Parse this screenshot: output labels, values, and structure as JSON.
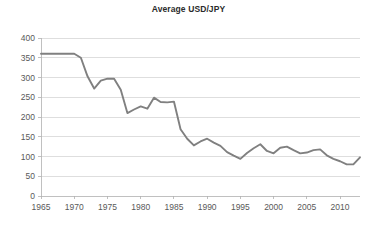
{
  "chart_data": {
    "type": "line",
    "title": "Average USD/JPY",
    "xlabel": "",
    "ylabel": "",
    "xlim": [
      1965,
      2013
    ],
    "ylim": [
      0,
      400
    ],
    "ytick_step": 50,
    "xtick_step": 5,
    "grid": true,
    "legend": false,
    "series_color": "#808080",
    "axis_color": "#b0b0b0",
    "grid_color": "#d0d0d0",
    "text_color": "#595959",
    "yticks": [
      0,
      50,
      100,
      150,
      200,
      250,
      300,
      350,
      400
    ],
    "ytick_labels": [
      "0",
      "50",
      "100",
      "150",
      "200",
      "250",
      "300",
      "350",
      "400"
    ],
    "xticks": [
      1965,
      1970,
      1975,
      1980,
      1985,
      1990,
      1995,
      2000,
      2005,
      2010
    ],
    "xtick_labels": [
      "1965",
      "1970",
      "1975",
      "1980",
      "1985",
      "1990",
      "1995",
      "2000",
      "2005",
      "2010"
    ],
    "x": [
      1965,
      1966,
      1967,
      1968,
      1969,
      1970,
      1971,
      1972,
      1973,
      1974,
      1975,
      1976,
      1977,
      1978,
      1979,
      1980,
      1981,
      1982,
      1983,
      1984,
      1985,
      1986,
      1987,
      1988,
      1989,
      1990,
      1991,
      1992,
      1993,
      1994,
      1995,
      1996,
      1997,
      1998,
      1999,
      2000,
      2001,
      2002,
      2003,
      2004,
      2005,
      2006,
      2007,
      2008,
      2009,
      2010,
      2011,
      2012,
      2013
    ],
    "series": [
      {
        "name": "Average USD/JPY",
        "values": [
          360,
          360,
          360,
          360,
          360,
          360,
          350,
          303,
          272,
          292,
          297,
          297,
          269,
          210,
          219,
          227,
          221,
          249,
          238,
          237,
          239,
          169,
          145,
          128,
          138,
          145,
          135,
          127,
          111,
          102,
          94,
          109,
          121,
          131,
          114,
          108,
          122,
          125,
          116,
          108,
          110,
          116,
          118,
          103,
          94,
          88,
          80,
          80,
          98
        ]
      }
    ]
  }
}
